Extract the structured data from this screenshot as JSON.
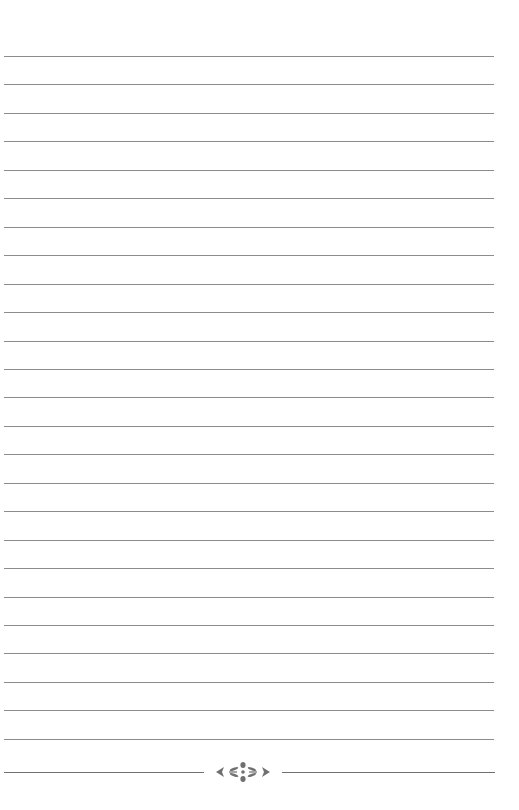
{
  "page": {
    "type": "lined-notebook-page",
    "background_color": "#ffffff",
    "rule_color": "#8c8c8c",
    "ornament_color": "#707070",
    "rule_count": 25,
    "first_rule_y": 56,
    "rule_spacing": 28.45,
    "ornament": {
      "name": "floral-divider",
      "y": 772
    }
  }
}
